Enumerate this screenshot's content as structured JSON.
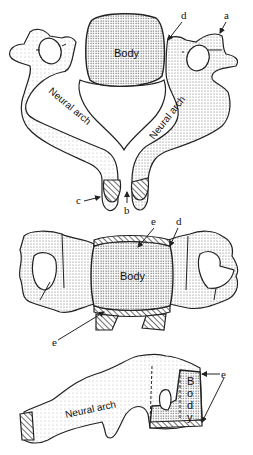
{
  "figure": {
    "top_view": {
      "body_label": "Body",
      "arch_left_label": "Neural arch",
      "arch_right_label": "Neural arch",
      "labels": {
        "a": "a",
        "b": "b",
        "c": "c",
        "d": "d"
      }
    },
    "front_view": {
      "body_label": "Body",
      "labels": {
        "d": "d",
        "e_top": "e",
        "e_bottom": "e"
      }
    },
    "side_view": {
      "arch_label": "Neural arch",
      "body_letters": [
        "B",
        "o",
        "d",
        "y"
      ],
      "labels": {
        "e": "e"
      }
    }
  }
}
